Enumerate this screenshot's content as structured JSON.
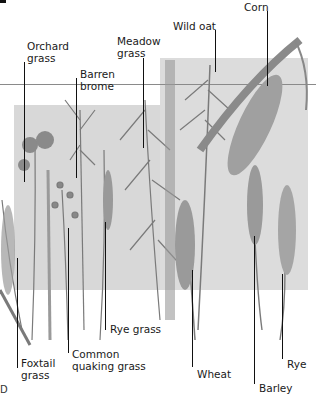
{
  "diagram": {
    "type": "illustrated grasses and cereals identification plate",
    "style": "grayscale botanical illustration with callout labels",
    "colors": {
      "background": "#ffffff",
      "backdrop": "#d8d8d8",
      "plant": "#7a7a7a",
      "leader_line": "#111111",
      "text": "#1a1a1a"
    },
    "labels": {
      "orchard_grass": "Orchard\ngrass",
      "barren_brome": "Barren\nbrome",
      "meadow_grass": "Meadow\ngrass",
      "wild_oat": "Wild oat",
      "corn": "Corn",
      "foxtail_grass": "Foxtail\ngrass",
      "common_quaking_grass": "Common\nquaking grass",
      "rye_grass": "Rye grass",
      "wheat": "Wheat",
      "barley": "Barley",
      "rye": "Rye"
    },
    "stray_mark": "D"
  }
}
